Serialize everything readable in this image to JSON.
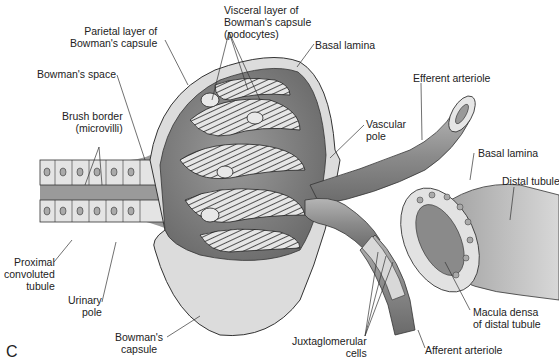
{
  "figure": {
    "panel_letter": "C",
    "labels": {
      "parietal_layer": "Parietal layer of\nBowman's capsule",
      "visceral_layer": "Visceral layer of\nBowman's capsule\n(podocytes)",
      "basal_lamina_top": "Basal lamina",
      "bowmans_space": "Bowman's space",
      "brush_border": "Brush border\n(microvilli)",
      "efferent_arteriole": "Efferent arteriole",
      "vascular_pole": "Vascular\npole",
      "basal_lamina_right": "Basal lamina",
      "distal_tubule": "Distal tubule",
      "proximal_tubule": "Proximal\nconvoluted\ntubule",
      "urinary_pole": "Urinary\npole",
      "bowmans_capsule": "Bowman's\ncapsule",
      "juxtaglomerular": "Juxtaglomerular\ncells",
      "macula_densa": "Macula densa\nof distal tubule",
      "afferent_arteriole": "Afferent arteriole"
    },
    "colors": {
      "capsule_outer": "#d8d8d8",
      "capsule_inner": "#8a8a8a",
      "glomerulus": "#555555",
      "vessel": "#9a9a9a",
      "tubule": "#c8c8c8",
      "line": "#333333"
    }
  }
}
